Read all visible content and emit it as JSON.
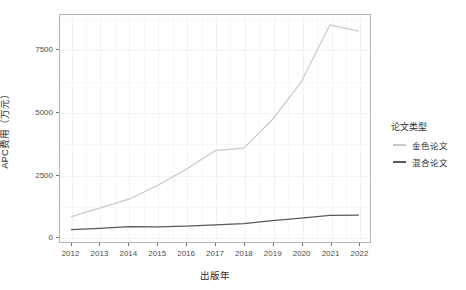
{
  "chart_data": {
    "type": "line",
    "title": "",
    "xlabel": "出版年",
    "ylabel": "APC费用（万元）",
    "x": [
      2012,
      2013,
      2014,
      2015,
      2016,
      2017,
      2018,
      2019,
      2020,
      2021,
      2022
    ],
    "categories": [
      "2012",
      "2013",
      "2014",
      "2015",
      "2016",
      "2017",
      "2018",
      "2019",
      "2020",
      "2021",
      "2022"
    ],
    "series": [
      {
        "name": "金色论文",
        "color": "#c8c8c8",
        "values": [
          800,
          1150,
          1500,
          2050,
          2700,
          3450,
          3550,
          4700,
          6200,
          8500,
          8250
        ]
      },
      {
        "name": "混合论文",
        "color": "#595959",
        "values": [
          280,
          330,
          400,
          390,
          420,
          470,
          520,
          640,
          740,
          850,
          860
        ]
      }
    ],
    "xlim": [
      2011.6,
      2022.4
    ],
    "ylim": [
      -220,
      8900
    ],
    "yticks": [
      0,
      2500,
      5000,
      7500
    ],
    "ytick_labels": [
      "0",
      "2500",
      "5000",
      "7500"
    ],
    "grid": true,
    "legend_position": "right",
    "legend_title": "论文类型"
  },
  "legend": {
    "title": "论文类型",
    "items": [
      {
        "label": "金色论文",
        "color": "#c8c8c8"
      },
      {
        "label": "混合论文",
        "color": "#595959"
      }
    ]
  },
  "axes": {
    "y_title": "APC费用（万元）",
    "x_title": "出版年"
  }
}
